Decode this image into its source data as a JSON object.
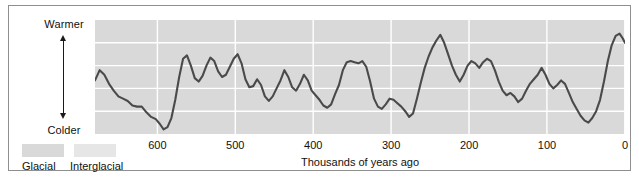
{
  "chart_data": {
    "type": "line",
    "title": "",
    "xlabel": "Thousands of years ago",
    "ylabel": "",
    "xticks": [
      600,
      500,
      400,
      300,
      200,
      100,
      0
    ],
    "xlim": [
      680,
      0
    ],
    "ylim": [
      0,
      100
    ],
    "grid": true,
    "axis_direction": "reversed",
    "y_axis_annotation": {
      "top": "Warmer",
      "bottom": "Colder"
    },
    "legend": {
      "position": "bottom-left",
      "entries": [
        {
          "label": "Glacial",
          "color": "#d9d9d9"
        },
        {
          "label": "Interglacial",
          "color": "#e6e6e6"
        }
      ]
    },
    "series": [
      {
        "name": "Relative temperature",
        "color": "#4a4a4a",
        "x": [
          680,
          674,
          668,
          662,
          656,
          650,
          644,
          638,
          632,
          626,
          620,
          614,
          608,
          602,
          597,
          592,
          587,
          582,
          577,
          572,
          567,
          562,
          557,
          552,
          547,
          542,
          537,
          532,
          527,
          522,
          517,
          512,
          507,
          502,
          497,
          492,
          487,
          482,
          477,
          472,
          467,
          462,
          457,
          452,
          447,
          442,
          437,
          432,
          427,
          422,
          417,
          412,
          407,
          402,
          397,
          392,
          387,
          382,
          377,
          372,
          367,
          362,
          357,
          352,
          347,
          342,
          337,
          332,
          327,
          322,
          317,
          312,
          307,
          302,
          297,
          292,
          287,
          282,
          277,
          272,
          267,
          262,
          257,
          252,
          247,
          242,
          237,
          232,
          227,
          222,
          217,
          212,
          207,
          202,
          197,
          192,
          187,
          182,
          177,
          172,
          167,
          162,
          157,
          152,
          147,
          142,
          137,
          132,
          127,
          122,
          117,
          112,
          107,
          102,
          97,
          92,
          87,
          82,
          77,
          72,
          67,
          62,
          57,
          52,
          47,
          42,
          37,
          32,
          27,
          22,
          17,
          12,
          7,
          3,
          0
        ],
        "values": [
          47,
          56,
          52,
          44,
          38,
          33,
          31,
          29,
          25,
          24,
          24,
          19,
          15,
          13,
          9,
          4,
          6,
          14,
          30,
          50,
          66,
          69,
          60,
          49,
          46,
          51,
          60,
          67,
          64,
          55,
          50,
          52,
          59,
          66,
          70,
          62,
          48,
          41,
          42,
          48,
          43,
          33,
          29,
          33,
          40,
          47,
          56,
          50,
          41,
          38,
          44,
          52,
          47,
          38,
          34,
          30,
          25,
          23,
          26,
          35,
          43,
          56,
          63,
          64,
          63,
          62,
          64,
          59,
          46,
          31,
          24,
          22,
          26,
          31,
          30,
          27,
          24,
          20,
          15,
          18,
          31,
          45,
          58,
          68,
          76,
          82,
          87,
          80,
          70,
          60,
          52,
          46,
          52,
          60,
          64,
          62,
          58,
          63,
          66,
          64,
          56,
          46,
          38,
          34,
          36,
          33,
          28,
          31,
          38,
          44,
          48,
          52,
          58,
          52,
          44,
          40,
          43,
          47,
          44,
          36,
          28,
          22,
          16,
          12,
          10,
          14,
          20,
          30,
          46,
          64,
          78,
          86,
          88,
          84,
          80
        ]
      }
    ]
  },
  "plot_style": {
    "band_color": "#d9d9d9",
    "gridline_color": "#ffffff",
    "line_color": "#4a4a4a",
    "frame_border": "#8f8f8f",
    "background": "#ffffff"
  }
}
